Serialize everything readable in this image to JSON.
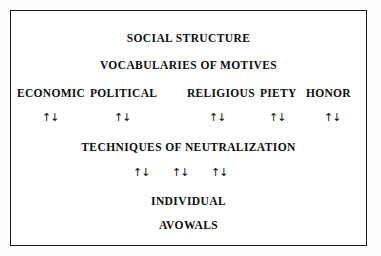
{
  "figure": {
    "title_lines": {
      "social_structure": "SOCIAL STRUCTURE",
      "vocabularies_of_motives": "VOCABULARIES OF MOTIVES",
      "techniques_of_neutralization": "TECHNIQUES OF NEUTRALIZATION",
      "individual": "INDIVIDUAL",
      "avowals": "AVOWALS"
    },
    "motive_categories": [
      {
        "label": "ECONOMIC"
      },
      {
        "label": "POLITICAL"
      },
      {
        "label": "RELIGIOUS"
      },
      {
        "label": "PIETY"
      },
      {
        "label": "HONOR"
      }
    ],
    "upper_arrows": [
      {
        "glyph": "↑↓"
      },
      {
        "glyph": "↑↓"
      },
      {
        "glyph": "↑↓"
      },
      {
        "glyph": "↑↓"
      },
      {
        "glyph": "↑↓"
      }
    ],
    "lower_arrows": [
      {
        "glyph": "↑↓"
      },
      {
        "glyph": "↑↓"
      },
      {
        "glyph": "↑↓"
      }
    ],
    "colors": {
      "ink": "#0d0d0d",
      "border": "#1a1a1a",
      "paper": "#ffffff",
      "page": "#fdfdfc"
    }
  }
}
